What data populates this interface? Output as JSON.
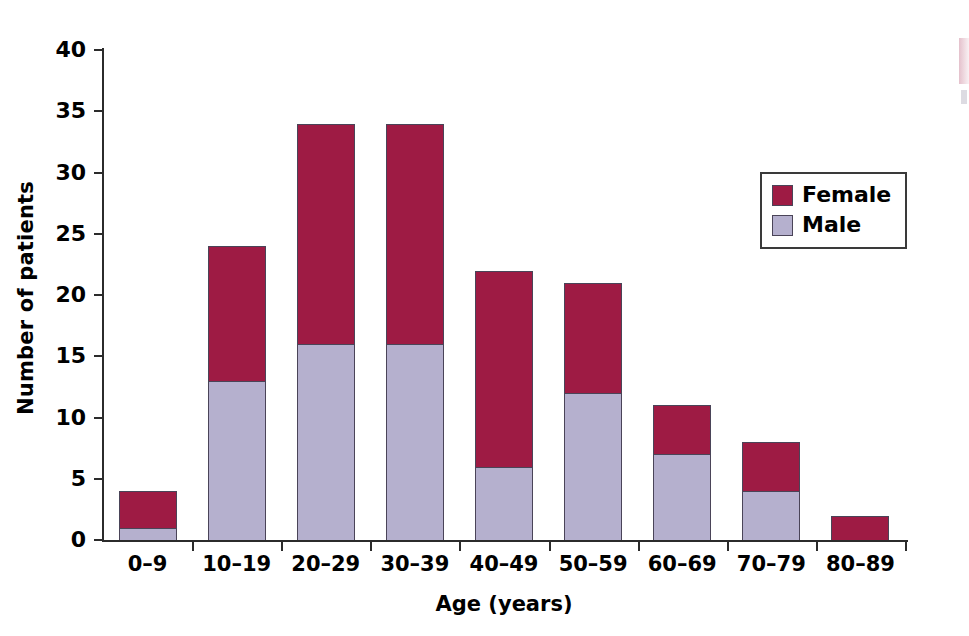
{
  "chart_data": {
    "type": "bar",
    "subtype": "stacked-bar",
    "title": "",
    "xlabel": "Age (years)",
    "ylabel": "Number of patients",
    "categories": [
      "0–9",
      "10–19",
      "20–29",
      "30–39",
      "40–49",
      "50–59",
      "60–69",
      "70–79",
      "80–89"
    ],
    "series": [
      {
        "name": "Male",
        "color": "#b5b0ce",
        "values": [
          1,
          13,
          16,
          16,
          6,
          12,
          7,
          4,
          0
        ]
      },
      {
        "name": "Female",
        "color": "#9e1b44",
        "values": [
          3,
          11,
          18,
          18,
          16,
          9,
          4,
          4,
          2
        ]
      }
    ],
    "totals": [
      4,
      24,
      34,
      34,
      22,
      21,
      11,
      8,
      2
    ],
    "ylim": [
      0,
      40
    ],
    "ytick_step": 5,
    "yticks": [
      "0",
      "5",
      "10",
      "15",
      "20",
      "25",
      "30",
      "35",
      "40"
    ],
    "grid": false,
    "legend_position": "inside-upper-right"
  },
  "legend": {
    "entries": [
      {
        "label": "Female",
        "color": "#9e1b44"
      },
      {
        "label": "Male",
        "color": "#b5b0ce"
      }
    ]
  },
  "colors": {
    "female": "#9e1b44",
    "male": "#b5b0ce",
    "axis": "#2b2b2b",
    "bar_outline": "#4a4458",
    "background": "#ffffff"
  }
}
